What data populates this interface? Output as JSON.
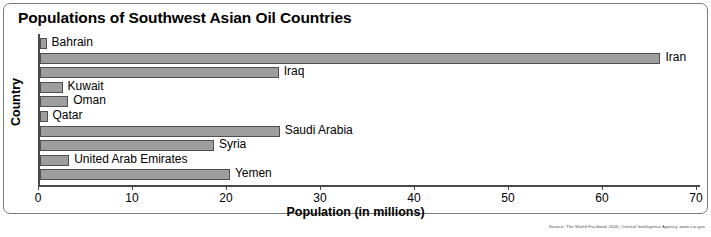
{
  "chart_data": {
    "type": "bar",
    "orientation": "horizontal",
    "title": "Populations of Southwest Asian Oil Countries",
    "xlabel": "Population (in millions)",
    "ylabel": "Country",
    "xlim": [
      0,
      70
    ],
    "xticks": [
      0,
      10,
      20,
      30,
      40,
      50,
      60,
      70
    ],
    "grid": false,
    "legend": "none",
    "categories": [
      "Bahrain",
      "Iran",
      "Iraq",
      "Kuwait",
      "Oman",
      "Qatar",
      "Saudi Arabia",
      "Syria",
      "United Arab Emirates",
      "Yemen"
    ],
    "values": [
      0.7,
      66.0,
      25.4,
      2.4,
      3.0,
      0.8,
      25.5,
      18.5,
      3.1,
      20.2
    ],
    "bar_color": "#9e9e9e",
    "bar_border_color": "#4f4f4f",
    "axis_color": "#4a4a4a"
  },
  "source": {
    "note": "Source: The World Factbook 2005, Central Intelligence Agency, www.cia.gov"
  }
}
